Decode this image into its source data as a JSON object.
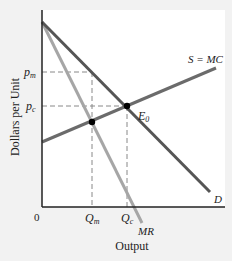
{
  "diagram": {
    "type": "economics-monopoly-vs-competition",
    "axes": {
      "y_label": "Dollars per Unit",
      "x_label": "Output",
      "origin_label": "0"
    },
    "price_labels": {
      "pm": {
        "base": "p",
        "sub": "m"
      },
      "pc": {
        "base": "p",
        "sub": "c"
      }
    },
    "quantity_labels": {
      "qm": {
        "base": "Q",
        "sub": "m"
      },
      "qc": {
        "base": "Q",
        "sub": "c"
      }
    },
    "curves": {
      "supply": {
        "label": "S = MC",
        "color": "#6b6b6b"
      },
      "demand": {
        "label": "D",
        "color": "#555555"
      },
      "marginal_revenue": {
        "label": "MR",
        "color": "#a6a6a6"
      }
    },
    "points": {
      "equilibrium": {
        "base": "E",
        "sub": "0"
      }
    },
    "colors": {
      "background": "#f2f2f2",
      "plot_area": "#ffffff",
      "axis": "#222222",
      "dashed": "#888888",
      "point": "#000000"
    }
  }
}
